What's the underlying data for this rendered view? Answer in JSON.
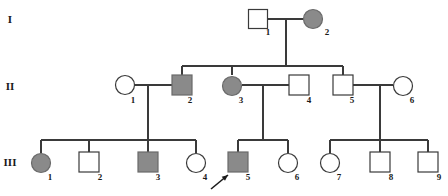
{
  "figure": {
    "kind": "pedigree-chart",
    "width": 448,
    "height": 196,
    "background_color": "#ffffff",
    "line_color": "#3a3a3a",
    "affected_fill_color": "#8a8a8a",
    "unaffected_fill_color": "#ffffff"
  },
  "legend_semantics": {
    "square": "male",
    "circle": "female",
    "filled": "affected",
    "open": "unaffected",
    "arrow": "proband"
  },
  "generations": [
    {
      "label": "I",
      "label_x": 10,
      "label_y": 20,
      "row_y": 19
    },
    {
      "label": "II",
      "label_x": 10,
      "label_y": 87,
      "row_y": 85
    },
    {
      "label": "III",
      "label_x": 10,
      "label_y": 163,
      "row_y": 163
    }
  ],
  "individuals": [
    {
      "id": "I-1",
      "number": "1",
      "generation": "I",
      "sex": "male",
      "shape": "square",
      "affected": false,
      "cx": 258,
      "cy": 19,
      "size": 19,
      "num_x": 268,
      "num_y": 33
    },
    {
      "id": "I-2",
      "number": "2",
      "generation": "I",
      "sex": "female",
      "shape": "circle",
      "affected": true,
      "cx": 313,
      "cy": 19,
      "size": 19,
      "num_x": 327,
      "num_y": 33
    },
    {
      "id": "II-1",
      "number": "1",
      "generation": "II",
      "sex": "female",
      "shape": "circle",
      "affected": false,
      "cx": 125,
      "cy": 85,
      "size": 19,
      "num_x": 133,
      "num_y": 101
    },
    {
      "id": "II-2",
      "number": "2",
      "generation": "II",
      "sex": "male",
      "shape": "square",
      "affected": true,
      "cx": 182,
      "cy": 85,
      "size": 20,
      "num_x": 190,
      "num_y": 101
    },
    {
      "id": "II-3",
      "number": "3",
      "generation": "II",
      "sex": "female",
      "shape": "circle",
      "affected": true,
      "cx": 232,
      "cy": 86,
      "size": 19,
      "num_x": 241,
      "num_y": 101
    },
    {
      "id": "II-4",
      "number": "4",
      "generation": "II",
      "sex": "male",
      "shape": "square",
      "affected": false,
      "cx": 299,
      "cy": 85,
      "size": 20,
      "num_x": 309,
      "num_y": 101
    },
    {
      "id": "II-5",
      "number": "5",
      "generation": "II",
      "sex": "male",
      "shape": "square",
      "affected": false,
      "cx": 343,
      "cy": 85,
      "size": 20,
      "num_x": 352,
      "num_y": 101
    },
    {
      "id": "II-6",
      "number": "6",
      "generation": "II",
      "sex": "female",
      "shape": "circle",
      "affected": false,
      "cx": 403,
      "cy": 86,
      "size": 19,
      "num_x": 412,
      "num_y": 101
    },
    {
      "id": "III-1",
      "number": "1",
      "generation": "III",
      "sex": "female",
      "shape": "circle",
      "affected": true,
      "cx": 41,
      "cy": 163,
      "size": 19,
      "num_x": 50,
      "num_y": 178
    },
    {
      "id": "III-2",
      "number": "2",
      "generation": "III",
      "sex": "male",
      "shape": "square",
      "affected": false,
      "cx": 89,
      "cy": 162,
      "size": 20,
      "num_x": 100,
      "num_y": 178
    },
    {
      "id": "III-3",
      "number": "3",
      "generation": "III",
      "sex": "male",
      "shape": "square",
      "affected": true,
      "cx": 148,
      "cy": 162,
      "size": 20,
      "num_x": 158,
      "num_y": 178
    },
    {
      "id": "III-4",
      "number": "4",
      "generation": "III",
      "sex": "female",
      "shape": "circle",
      "affected": false,
      "cx": 196,
      "cy": 163,
      "size": 19,
      "num_x": 205,
      "num_y": 178
    },
    {
      "id": "III-5",
      "number": "5",
      "generation": "III",
      "sex": "male",
      "shape": "square",
      "affected": true,
      "cx": 238,
      "cy": 162,
      "size": 20,
      "num_x": 248,
      "num_y": 178
    },
    {
      "id": "III-6",
      "number": "6",
      "generation": "III",
      "sex": "female",
      "shape": "circle",
      "affected": false,
      "cx": 288,
      "cy": 163,
      "size": 19,
      "num_x": 297,
      "num_y": 178
    },
    {
      "id": "III-7",
      "number": "7",
      "generation": "III",
      "sex": "female",
      "shape": "circle",
      "affected": false,
      "cx": 330,
      "cy": 163,
      "size": 19,
      "num_x": 339,
      "num_y": 178
    },
    {
      "id": "III-8",
      "number": "8",
      "generation": "III",
      "sex": "male",
      "shape": "square",
      "affected": false,
      "cx": 380,
      "cy": 162,
      "size": 20,
      "num_x": 391,
      "num_y": 178
    },
    {
      "id": "III-9",
      "number": "9",
      "generation": "III",
      "sex": "male",
      "shape": "square",
      "affected": false,
      "cx": 428,
      "cy": 162,
      "size": 20,
      "num_x": 439,
      "num_y": 178
    }
  ],
  "matings": [
    {
      "id": "mating-I",
      "partners": [
        "I-1",
        "I-2"
      ],
      "x1": 268,
      "x2": 303,
      "y": 19,
      "drop_x": 286,
      "drop_y": 66
    },
    {
      "id": "mating-II-1-2",
      "partners": [
        "II-1",
        "II-2"
      ],
      "x1": 135,
      "x2": 172,
      "y": 85,
      "drop_x": 148,
      "drop_y": 140
    },
    {
      "id": "mating-II-3-4",
      "partners": [
        "II-3",
        "II-4"
      ],
      "x1": 242,
      "x2": 289,
      "y": 85,
      "drop_x": 263,
      "drop_y": 140
    },
    {
      "id": "mating-II-5-6",
      "partners": [
        "II-5",
        "II-6"
      ],
      "x1": 353,
      "x2": 393,
      "y": 85,
      "drop_x": 380,
      "drop_y": 140
    }
  ],
  "sibships": [
    {
      "id": "sibship-II",
      "parents": "mating-I",
      "bar_y": 66,
      "x_start": 182,
      "x_end": 343,
      "children": [
        "II-2",
        "II-3",
        "II-5"
      ],
      "drop_xs": [
        182,
        232,
        343
      ],
      "drop_to": 75
    },
    {
      "id": "sibship-III-a",
      "parents": "mating-II-1-2",
      "bar_y": 140,
      "x_start": 41,
      "x_end": 196,
      "children": [
        "III-1",
        "III-2",
        "III-3",
        "III-4"
      ],
      "drop_xs": [
        41,
        89,
        148,
        196
      ],
      "drop_to": 153
    },
    {
      "id": "sibship-III-b",
      "parents": "mating-II-3-4",
      "bar_y": 140,
      "x_start": 238,
      "x_end": 288,
      "children": [
        "III-5",
        "III-6"
      ],
      "drop_xs": [
        238,
        288
      ],
      "drop_to": 153
    },
    {
      "id": "sibship-III-c",
      "parents": "mating-II-5-6",
      "bar_y": 140,
      "x_start": 330,
      "x_end": 428,
      "children": [
        "III-7",
        "III-8",
        "III-9"
      ],
      "drop_xs": [
        330,
        380,
        428
      ],
      "drop_to": 153
    }
  ],
  "proband": {
    "target": "III-5",
    "marker": "arrow",
    "tail_x": 211,
    "tail_y": 189,
    "tip_x": 228,
    "tip_y": 175
  }
}
